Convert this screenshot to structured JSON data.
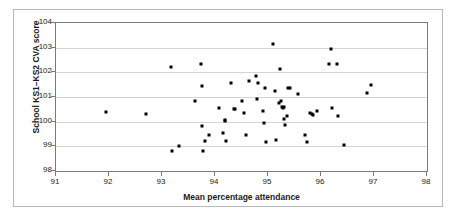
{
  "chart_data": {
    "type": "scatter",
    "title": "",
    "xlabel": "Mean percentage attendance",
    "ylabel": "School KS1–KS2 CVA score",
    "xlim": [
      91,
      98
    ],
    "ylim": [
      98,
      104
    ],
    "xticks": [
      91,
      92,
      93,
      94,
      95,
      96,
      97,
      98
    ],
    "yticks": [
      98,
      99,
      100,
      101,
      102,
      103,
      104
    ],
    "xtick_labels": [
      "91",
      "92",
      "93",
      "94",
      "95",
      "96",
      "97",
      "98"
    ],
    "ytick_labels": [
      "98",
      "99",
      "100",
      "101",
      "102",
      "103",
      "104"
    ],
    "grid": "horizontal",
    "legend": "none",
    "marker": "square",
    "marker_color": "#000000",
    "grid_color": "#d4d4d4",
    "axis_color": "#7a7a7a",
    "points": [
      [
        91.95,
        100.4
      ],
      [
        92.7,
        100.32
      ],
      [
        93.17,
        102.22
      ],
      [
        93.18,
        98.82
      ],
      [
        93.33,
        99.03
      ],
      [
        93.63,
        100.84
      ],
      [
        93.73,
        102.33
      ],
      [
        93.75,
        101.44
      ],
      [
        93.75,
        99.84
      ],
      [
        93.77,
        98.82
      ],
      [
        93.82,
        99.23
      ],
      [
        93.88,
        99.44
      ],
      [
        94.08,
        100.54
      ],
      [
        94.15,
        99.53
      ],
      [
        94.18,
        100.08
      ],
      [
        94.19,
        100.03
      ],
      [
        94.2,
        99.23
      ],
      [
        94.3,
        101.55
      ],
      [
        94.35,
        100.53
      ],
      [
        94.38,
        100.5
      ],
      [
        94.5,
        100.84
      ],
      [
        94.55,
        100.35
      ],
      [
        94.58,
        99.44
      ],
      [
        94.65,
        101.66
      ],
      [
        94.78,
        101.85
      ],
      [
        94.8,
        100.93
      ],
      [
        94.82,
        101.55
      ],
      [
        94.9,
        100.45
      ],
      [
        94.92,
        99.94
      ],
      [
        94.95,
        101.35
      ],
      [
        94.97,
        99.17
      ],
      [
        95.1,
        103.13
      ],
      [
        95.13,
        101.24
      ],
      [
        95.15,
        99.25
      ],
      [
        95.2,
        100.75
      ],
      [
        95.22,
        102.14
      ],
      [
        95.25,
        100.85
      ],
      [
        95.27,
        100.6
      ],
      [
        95.28,
        100.55
      ],
      [
        95.3,
        100.58
      ],
      [
        95.3,
        100.1
      ],
      [
        95.32,
        99.85
      ],
      [
        95.35,
        100.23
      ],
      [
        95.38,
        101.35
      ],
      [
        95.42,
        101.35
      ],
      [
        95.57,
        101.13
      ],
      [
        95.7,
        99.45
      ],
      [
        95.73,
        99.17
      ],
      [
        95.8,
        100.35
      ],
      [
        95.83,
        100.3
      ],
      [
        95.85,
        100.26
      ],
      [
        95.92,
        100.45
      ],
      [
        96.15,
        102.35
      ],
      [
        96.18,
        102.95
      ],
      [
        96.2,
        100.55
      ],
      [
        96.3,
        102.35
      ],
      [
        96.32,
        100.25
      ],
      [
        96.43,
        99.05
      ],
      [
        96.87,
        101.18
      ],
      [
        96.95,
        101.47
      ]
    ]
  }
}
